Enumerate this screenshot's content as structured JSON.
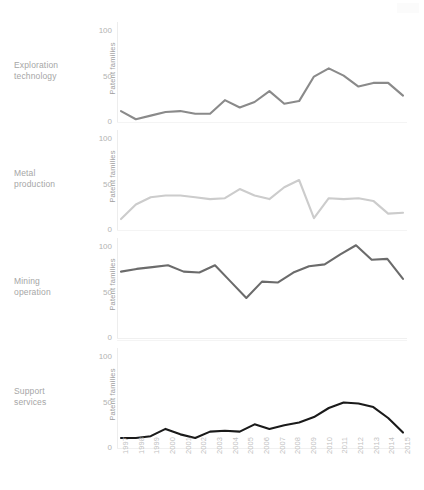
{
  "chart_data": {
    "type": "line",
    "title": "",
    "xlabel": "",
    "ylabel": "Patent families",
    "ylim": [
      0,
      110
    ],
    "yticks": [
      0,
      50,
      100
    ],
    "grid": false,
    "legend_position": "none",
    "x": [
      1997,
      1998,
      1999,
      2000,
      2001,
      2002,
      2003,
      2004,
      2005,
      2006,
      2007,
      2008,
      2009,
      2010,
      2011,
      2012,
      2013,
      2014,
      2015
    ],
    "categories": [
      "1997",
      "1998",
      "1999",
      "2000",
      "2001",
      "2002",
      "2003",
      "2004",
      "2005",
      "2006",
      "2007",
      "2008",
      "2009",
      "2010",
      "2011",
      "2012",
      "2013",
      "2014",
      "2015"
    ],
    "panels": [
      {
        "name": "Exploration technology",
        "label_line1": "Exploration",
        "label_line2": "technology",
        "ylabel": "Patent families",
        "color": "#8a8a8a",
        "values": [
          12,
          3,
          7,
          11,
          12,
          9,
          9,
          24,
          16,
          22,
          34,
          20,
          23,
          50,
          59,
          51,
          39,
          43,
          43,
          29
        ]
      },
      {
        "name": "Metal production",
        "label_line1": "Metal",
        "label_line2": "production",
        "ylabel": "Patent families",
        "color": "#cccccc",
        "values": [
          12,
          28,
          36,
          38,
          38,
          36,
          34,
          35,
          45,
          38,
          34,
          47,
          55,
          13,
          35,
          34,
          35,
          32,
          18,
          19
        ]
      },
      {
        "name": "Mining operation",
        "label_line1": "Mining",
        "label_line2": "operation",
        "ylabel": "Patent families",
        "color": "#6b6b6b",
        "values": [
          73,
          76,
          78,
          80,
          73,
          72,
          80,
          62,
          44,
          62,
          61,
          72,
          79,
          81,
          92,
          102,
          86,
          87,
          65
        ]
      },
      {
        "name": "Support services",
        "label_line1": "Support",
        "label_line2": "services",
        "ylabel": "Patent families",
        "color": "#1a1a1a",
        "values": [
          11,
          11,
          13,
          21,
          15,
          11,
          18,
          19,
          18,
          26,
          21,
          25,
          28,
          34,
          44,
          50,
          49,
          45,
          33,
          17
        ]
      }
    ]
  },
  "axis": {
    "tick_100": "100",
    "tick_50": "50",
    "tick_0": "0"
  }
}
